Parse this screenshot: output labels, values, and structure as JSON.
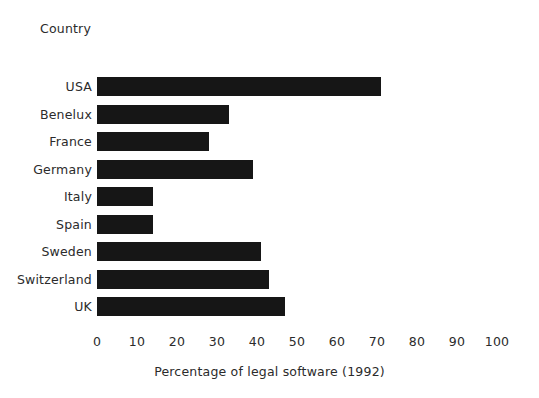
{
  "heading": "Country",
  "chart_data": {
    "type": "bar",
    "orientation": "horizontal",
    "title": "",
    "subtitle": "",
    "xlabel": "Percentage of legal software (1992)",
    "ylabel": "Country",
    "categories": [
      "USA",
      "Benelux",
      "France",
      "Germany",
      "Italy",
      "Spain",
      "Sweden",
      "Switzerland",
      "UK"
    ],
    "values": [
      71,
      33,
      28,
      39,
      14,
      14,
      41,
      43,
      47
    ],
    "xlim": [
      0,
      100
    ],
    "xticks": [
      0,
      10,
      20,
      30,
      40,
      50,
      60,
      70,
      80,
      90,
      100
    ],
    "xtick_labels": [
      "0",
      "10",
      "20",
      "30",
      "40",
      "50",
      "60",
      "70",
      "80",
      "90",
      "100"
    ],
    "grid": false,
    "legend": false,
    "bar_color": "#161616",
    "background_color": "#ffffff",
    "text_color": "#2b2b2b"
  }
}
